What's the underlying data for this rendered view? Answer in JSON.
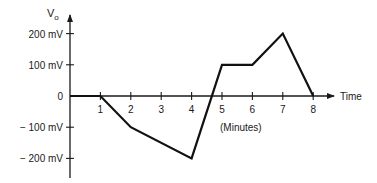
{
  "chart_data": {
    "type": "line",
    "title": "",
    "xlabel": "Time",
    "xlabel_units": "(Minutes)",
    "ylabel": "V",
    "ylabel_subscript": "o",
    "x": [
      0,
      1,
      2,
      4,
      5,
      6,
      7,
      8
    ],
    "series": [
      {
        "name": "Vo",
        "values": [
          0,
          0,
          -100,
          -200,
          100,
          100,
          200,
          0
        ],
        "units": "mV"
      }
    ],
    "x_ticks": [
      1,
      2,
      3,
      4,
      5,
      6,
      7,
      8
    ],
    "x_tick_labels": [
      "1",
      "2",
      "3",
      "4",
      "5",
      "6",
      "7",
      "8"
    ],
    "y_ticks": [
      200,
      100,
      0,
      -100,
      -200
    ],
    "y_tick_labels": [
      "200 mV",
      "100 mV",
      "0",
      "− 100 mV",
      "− 200 mV"
    ],
    "xlim": [
      0,
      8.6
    ],
    "ylim": [
      -250,
      260
    ],
    "grid": false,
    "legend": null
  },
  "labels": {
    "y_axis_main": "V",
    "y_axis_sub": "o",
    "x_axis": "Time",
    "x_units": "(Minutes)"
  }
}
